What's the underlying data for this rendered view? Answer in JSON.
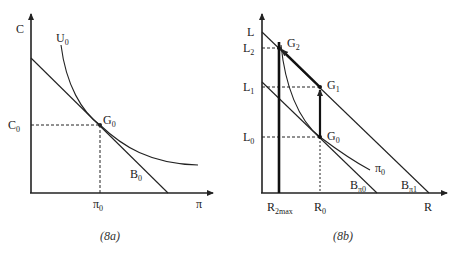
{
  "figures": [
    {
      "id": "8a",
      "caption": "(8a)",
      "y_axis_label": "C",
      "x_axis_label": "π",
      "curves": {
        "indifference": {
          "label": "U",
          "sub": "0"
        },
        "budget": {
          "label": "B",
          "sub": "0"
        }
      },
      "point": {
        "label": "G",
        "sub": "0"
      },
      "y_tick": {
        "label": "C",
        "sub": "0"
      },
      "x_tick": {
        "label": "π",
        "sub": "0"
      }
    },
    {
      "id": "8b",
      "caption": "(8b)",
      "y_axis_label": "L",
      "x_axis_label": "R",
      "curves": {
        "isoprofit": {
          "label": "π",
          "sub": "0"
        },
        "budget_0": {
          "label": "B",
          "sub": "π0"
        },
        "budget_1": {
          "label": "B",
          "sub": "π1"
        }
      },
      "points": [
        {
          "label": "G",
          "sub": "2"
        },
        {
          "label": "G",
          "sub": "1"
        },
        {
          "label": "G",
          "sub": "0"
        }
      ],
      "y_ticks": [
        {
          "label": "L",
          "sub": "2"
        },
        {
          "label": "L",
          "sub": "1"
        },
        {
          "label": "L",
          "sub": "0"
        }
      ],
      "x_ticks": [
        {
          "label": "R",
          "sub": "2max"
        },
        {
          "label": "R",
          "sub": "0"
        }
      ]
    }
  ]
}
